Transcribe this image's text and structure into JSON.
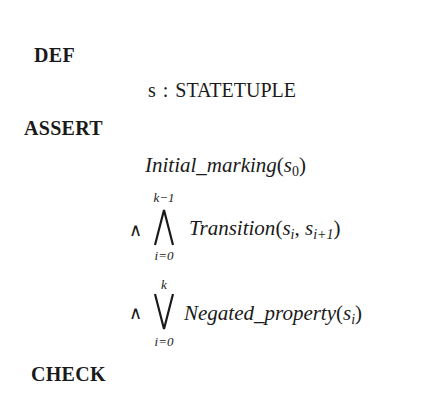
{
  "sections": {
    "def": {
      "keyword": "DEF",
      "declaration": {
        "variable": "s",
        "separator": ":",
        "type": "STATETUPLE"
      }
    },
    "assert": {
      "keyword": "ASSERT",
      "line1": {
        "predicate": "Initial_marking",
        "open": "(",
        "arg": "s",
        "arg_sub": "0",
        "close": ")"
      },
      "line2": {
        "connective": "∧",
        "operator": "big-and",
        "upper_limit": "k−1",
        "lower_limit": "i=0",
        "predicate": "Transition",
        "open": "(",
        "arg1": "s",
        "arg1_sub": "i",
        "comma": ", ",
        "arg2": "s",
        "arg2_sub": "i+1",
        "close": ")"
      },
      "line3": {
        "connective": "∧",
        "operator": "big-or",
        "upper_limit": "k",
        "lower_limit": "i=0",
        "predicate": "Negated_property",
        "open": "(",
        "arg": "s",
        "arg_sub": "i",
        "close": ")"
      }
    },
    "check": {
      "keyword": "CHECK"
    }
  }
}
